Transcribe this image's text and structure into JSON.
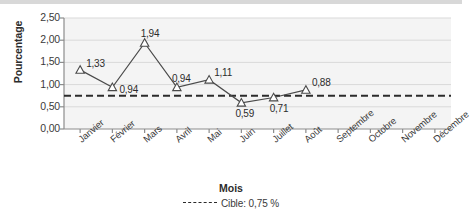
{
  "chart_data": {
    "type": "line",
    "title": "",
    "xlabel": "Mois",
    "ylabel": "Pourcentage",
    "categories": [
      "Janvier",
      "Février",
      "Mars",
      "Avril",
      "Mai",
      "Juin",
      "Juillet",
      "Août",
      "Septembre",
      "Octobre",
      "Novembre",
      "Décembre"
    ],
    "values": [
      1.33,
      0.94,
      1.94,
      0.94,
      1.11,
      0.59,
      0.71,
      0.88,
      null,
      null,
      null,
      null
    ],
    "point_labels": [
      "1,33",
      "0,94",
      "1,94",
      "0,94",
      "1,11",
      "0,59",
      "0,71",
      "0,88",
      "",
      "",
      "",
      ""
    ],
    "ylim": [
      0,
      2.5
    ],
    "ytick_values": [
      0,
      0.5,
      1.0,
      1.5,
      2.0,
      2.5
    ],
    "ytick_labels": [
      "0,00",
      "0,50",
      "1,00",
      "1,50",
      "2,00",
      "2,50"
    ],
    "grid": true,
    "grid_axis": "y",
    "marker": "triangle-open",
    "series_color": "#4a4a4a",
    "target_line": {
      "value": 0.75,
      "label": "Cible: 0,75 %",
      "style": "dashed",
      "color": "#2b2b2b"
    },
    "legend": {
      "position": "bottom",
      "entries": [
        "Cible: 0,75 %"
      ]
    },
    "plot_bg": "#f4f4f4",
    "label_offsets": [
      {
        "dx": 6,
        "dy": -12
      },
      {
        "dx": 7,
        "dy": -3
      },
      {
        "dx": -4,
        "dy": -15
      },
      {
        "dx": -5,
        "dy": -14
      },
      {
        "dx": 5,
        "dy": -13
      },
      {
        "dx": -6,
        "dy": 5
      },
      {
        "dx": -4,
        "dy": 6
      },
      {
        "dx": 6,
        "dy": -13
      }
    ]
  }
}
